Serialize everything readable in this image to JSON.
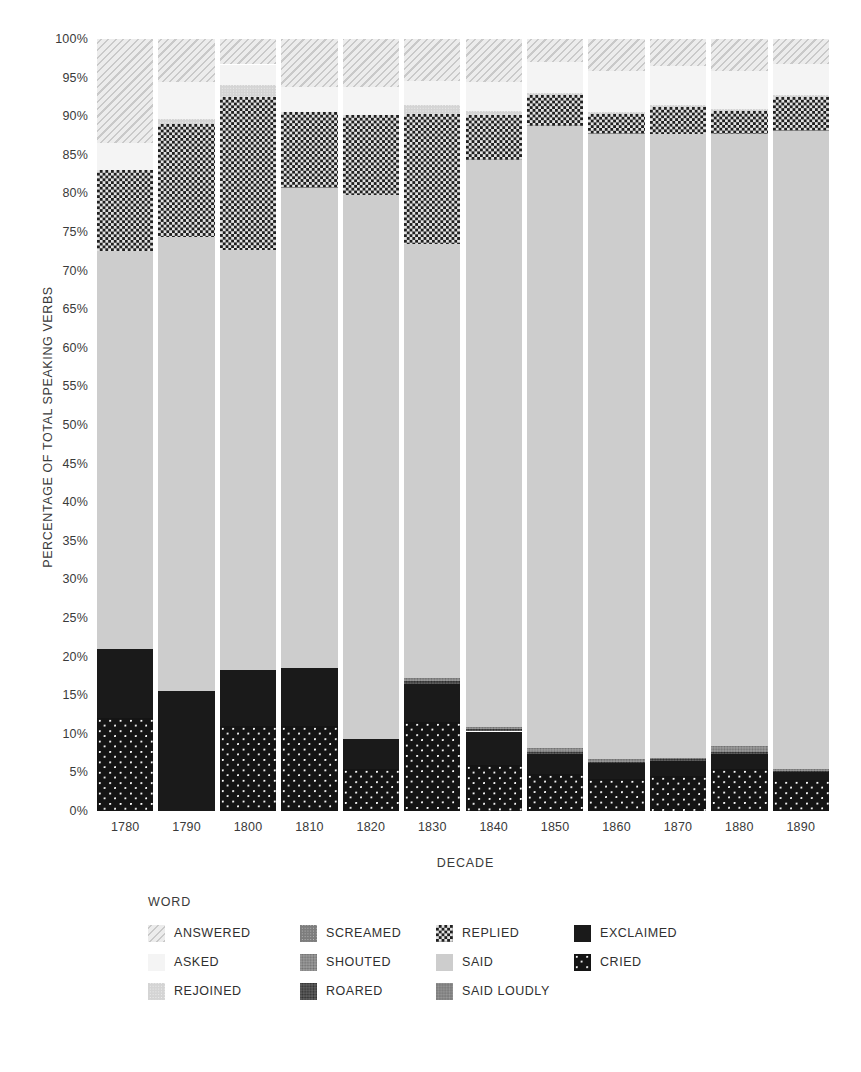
{
  "chart_data": {
    "type": "bar",
    "subtype": "stacked-100-percent",
    "title": "",
    "xlabel": "DECADE",
    "ylabel": "PERCENTAGE OF TOTAL SPEAKING VERBS",
    "legend_title": "WORD",
    "legend_position": "bottom",
    "grid": false,
    "ylim": [
      0,
      100
    ],
    "ytick_labels": [
      "0%",
      "5%",
      "10%",
      "15%",
      "20%",
      "25%",
      "30%",
      "35%",
      "40%",
      "45%",
      "50%",
      "55%",
      "60%",
      "65%",
      "70%",
      "75%",
      "80%",
      "85%",
      "90%",
      "95%",
      "100%"
    ],
    "ytick_values": [
      0,
      5,
      10,
      15,
      20,
      25,
      30,
      35,
      40,
      45,
      50,
      55,
      60,
      65,
      70,
      75,
      80,
      85,
      90,
      95,
      100
    ],
    "categories": [
      "1780",
      "1790",
      "1800",
      "1810",
      "1820",
      "1830",
      "1840",
      "1850",
      "1860",
      "1870",
      "1880",
      "1890"
    ],
    "stack_order_bottom_to_top": [
      "CRIED",
      "EXCLAIMED",
      "ROARED",
      "SHOUTED",
      "SAID LOUDLY",
      "SAID",
      "SCREAMED",
      "REPLIED",
      "REJOINED",
      "ASKED",
      "ANSWERED"
    ],
    "series": [
      {
        "name": "CRIED",
        "pattern": "black-with-white-dots",
        "color": "#141414",
        "values": [
          12.0,
          0.0,
          11.0,
          11.0,
          5.5,
          11.5,
          6.0,
          4.8,
          4.2,
          4.5,
          5.5,
          4.0
        ]
      },
      {
        "name": "EXCLAIMED",
        "pattern": "solid-black",
        "color": "#1a1a1a",
        "values": [
          9.0,
          15.5,
          7.3,
          7.5,
          3.8,
          5.0,
          4.3,
          2.6,
          2.0,
          2.0,
          1.9,
          1.0
        ]
      },
      {
        "name": "ROARED",
        "pattern": "dark-crosshatch",
        "color": "#2e2e2e",
        "values": [
          0.0,
          0.0,
          0.0,
          0.0,
          0.0,
          0.4,
          0.3,
          0.3,
          0.2,
          0.2,
          0.3,
          0.2
        ]
      },
      {
        "name": "SHOUTED",
        "pattern": "mid-gray-crosshatch",
        "color": "#6f6f6f",
        "values": [
          0.0,
          0.0,
          0.0,
          0.0,
          0.0,
          0.3,
          0.3,
          0.5,
          0.3,
          0.2,
          0.7,
          0.3
        ]
      },
      {
        "name": "SAID LOUDLY",
        "pattern": "gray-fine-weave",
        "color": "#9c9c9c",
        "values": [
          0.0,
          0.0,
          0.0,
          0.0,
          0.0,
          0.0,
          0.0,
          0.0,
          0.0,
          0.0,
          0.0,
          0.0
        ]
      },
      {
        "name": "SAID",
        "pattern": "light-gray-solid",
        "color": "#cdcdcd",
        "values": [
          51.5,
          58.8,
          54.4,
          62.2,
          70.5,
          56.3,
          73.4,
          80.5,
          81.0,
          80.8,
          79.3,
          82.6
        ]
      },
      {
        "name": "SCREAMED",
        "pattern": "gray-checker",
        "color": "#b9b9b9",
        "values": [
          0.0,
          0.0,
          0.0,
          0.0,
          0.0,
          0.0,
          0.0,
          0.0,
          0.0,
          0.0,
          0.0,
          0.0
        ]
      },
      {
        "name": "REPLIED",
        "pattern": "black-white-checker",
        "color": "#1f1f1f",
        "values": [
          10.5,
          14.7,
          19.8,
          9.8,
          10.4,
          16.8,
          5.9,
          4.0,
          2.6,
          3.5,
          3.0,
          4.4
        ]
      },
      {
        "name": "REJOINED",
        "pattern": "light-checker",
        "color": "#efefef",
        "values": [
          0.0,
          0.6,
          1.6,
          0.0,
          0.0,
          1.1,
          0.5,
          0.3,
          0.2,
          0.2,
          0.2,
          0.2
        ]
      },
      {
        "name": "ASKED",
        "pattern": "very-light-solid",
        "color": "#f4f4f4",
        "values": [
          3.5,
          4.8,
          2.6,
          3.3,
          3.6,
          3.1,
          3.7,
          4.0,
          5.3,
          5.1,
          5.0,
          4.0
        ]
      },
      {
        "name": "ANSWERED",
        "pattern": "diagonal-hatch",
        "color": "#ececec",
        "values": [
          13.5,
          5.6,
          3.3,
          6.2,
          6.2,
          5.5,
          5.6,
          3.0,
          4.2,
          3.5,
          4.1,
          3.3
        ]
      }
    ],
    "legend_entries": [
      {
        "label": "ANSWERED",
        "pattern": "diagonal-hatch"
      },
      {
        "label": "ASKED",
        "pattern": "very-light-solid"
      },
      {
        "label": "REJOINED",
        "pattern": "light-checker"
      },
      {
        "label": "SCREAMED",
        "pattern": "gray-checker"
      },
      {
        "label": "SHOUTED",
        "pattern": "mid-gray-crosshatch"
      },
      {
        "label": "ROARED",
        "pattern": "dark-crosshatch"
      },
      {
        "label": "REPLIED",
        "pattern": "black-white-checker"
      },
      {
        "label": "SAID",
        "pattern": "light-gray-solid"
      },
      {
        "label": "SAID LOUDLY",
        "pattern": "gray-fine-weave"
      },
      {
        "label": "EXCLAIMED",
        "pattern": "solid-black"
      },
      {
        "label": "CRIED",
        "pattern": "black-with-white-dots"
      }
    ]
  },
  "axes": {
    "y_title": "PERCENTAGE OF TOTAL SPEAKING VERBS",
    "x_title": "DECADE"
  },
  "legend": {
    "title": "WORD"
  }
}
